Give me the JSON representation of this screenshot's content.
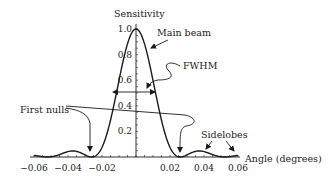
{
  "chart_data": {
    "type": "line",
    "title": "",
    "xlabel": "Angle (degrees)",
    "ylabel": "Sensitivity",
    "xlim": [
      -0.06,
      0.06
    ],
    "ylim": [
      0,
      1.0
    ],
    "grid": false,
    "legend": "none",
    "x_ticks": [
      -0.06,
      -0.04,
      -0.02,
      0.02,
      0.04,
      0.06
    ],
    "x_tick_labels": [
      "−0.06",
      "−0.04",
      "−0.02",
      "0.02",
      "0.04",
      "0.06"
    ],
    "y_ticks": [
      0.2,
      0.4,
      0.6,
      0.8,
      1.0
    ],
    "y_tick_labels": [
      "0.2",
      "0.4",
      "0.6",
      "0.8",
      "1.0"
    ],
    "series": [
      {
        "name": "Beam pattern (sinc²)",
        "x": [
          -0.06,
          -0.05,
          -0.04,
          -0.035,
          -0.03,
          -0.026,
          -0.02,
          -0.015,
          -0.01,
          -0.005,
          0,
          0.005,
          0.01,
          0.015,
          0.02,
          0.026,
          0.03,
          0.035,
          0.04,
          0.05,
          0.06
        ],
        "y": [
          0.01,
          0.02,
          0.045,
          0.047,
          0.02,
          0.0,
          0.12,
          0.42,
          0.75,
          0.94,
          1.0,
          0.94,
          0.75,
          0.42,
          0.12,
          0.0,
          0.02,
          0.047,
          0.045,
          0.02,
          0.01
        ]
      }
    ],
    "annotations": [
      {
        "text": "Main beam",
        "points_to": [
          0.004,
          0.94
        ]
      },
      {
        "text": "FWHM",
        "points_to": [
          0.002,
          0.5
        ],
        "width_from": -0.0095,
        "width_to": 0.0095,
        "level": 0.5
      },
      {
        "text": "First nulls",
        "points_to": [
          [
            -0.026,
            0.0
          ],
          [
            0.026,
            0.0
          ]
        ]
      },
      {
        "text": "Sidelobes",
        "points_to": [
          [
            0.04,
            0.047
          ],
          [
            0.058,
            0.01
          ]
        ]
      }
    ]
  },
  "labels": {
    "ylabel": "Sensitivity",
    "xlabel": "Angle (degrees)",
    "main_beam": "Main beam",
    "fwhm": "FWHM",
    "first_nulls": "First nulls",
    "sidelobes": "Sidelobes"
  }
}
